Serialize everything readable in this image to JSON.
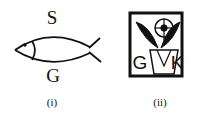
{
  "figures": [
    {
      "caption": "(i)",
      "label_top": "S",
      "label_bottom": "G",
      "symbol": "fish-icon"
    },
    {
      "caption": "(ii)",
      "label_left": "G",
      "label_right": "K",
      "symbol": "flower-pot-emblem-icon"
    }
  ]
}
